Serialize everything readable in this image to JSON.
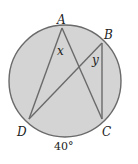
{
  "diagram": {
    "type": "inscribed-angles-circle",
    "circle": {
      "cx": 65,
      "cy": 81,
      "r": 56,
      "fill": "#d4d4d4",
      "stroke": "#6a6a6a"
    },
    "points": {
      "A": {
        "label": "A",
        "x": 62,
        "y": 28
      },
      "B": {
        "label": "B",
        "x": 102,
        "y": 43
      },
      "C": {
        "label": "C",
        "x": 102,
        "y": 119
      },
      "D": {
        "label": "D",
        "x": 29,
        "y": 119
      }
    },
    "segments": [
      [
        "A",
        "D"
      ],
      [
        "A",
        "C"
      ],
      [
        "D",
        "B"
      ],
      [
        "B",
        "C"
      ]
    ],
    "angle_labels": {
      "x": "x",
      "y": "y"
    },
    "arc_label": "40°"
  }
}
